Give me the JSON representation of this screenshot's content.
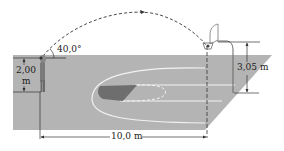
{
  "figure": {
    "labels": {
      "launch_angle": "40,0°",
      "release_height_value": "2,00",
      "release_height_unit": "m",
      "hoop_height": "3,05 m",
      "horizontal_distance": "10,0 m"
    },
    "colors": {
      "court": "#b4b4b4",
      "court_lines": "#f2f2f2",
      "key_dark": "#6e6e6e",
      "lines": "#333333",
      "player": "#8a8a8a",
      "background": "#ffffff"
    }
  }
}
